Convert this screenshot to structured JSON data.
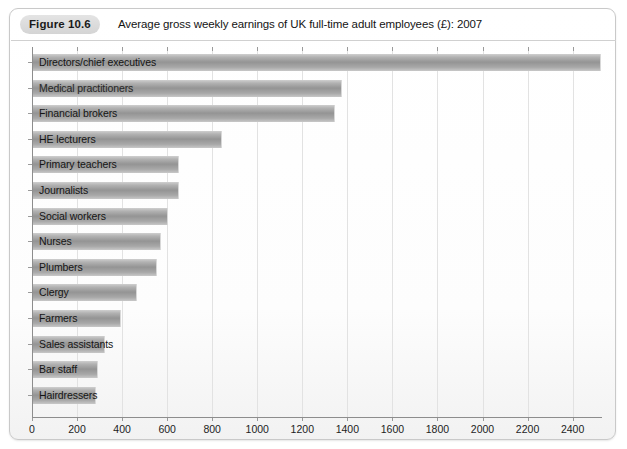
{
  "figure": {
    "badge": "Figure 10.6",
    "title": "Average gross weekly earnings of UK full-time adult employees (£): 2007"
  },
  "chart_data": {
    "type": "bar",
    "orientation": "horizontal",
    "title": "Average gross weekly earnings of UK full-time adult employees (£): 2007",
    "xlabel": "",
    "ylabel": "",
    "xlim": [
      0,
      2530
    ],
    "xticks": [
      0,
      200,
      400,
      600,
      800,
      1000,
      1200,
      1400,
      1600,
      1800,
      2000,
      2200,
      2400
    ],
    "grid": true,
    "legend": false,
    "bar_color": "#9a9a9a",
    "categories": [
      "Directors/chief executives",
      "Medical practitioners",
      "Financial brokers",
      "HE lecturers",
      "Primary teachers",
      "Journalists",
      "Social workers",
      "Nurses",
      "Plumbers",
      "Clergy",
      "Farmers",
      "Sales assistants",
      "Bar staff",
      "Hairdressers"
    ],
    "values": [
      2520,
      1370,
      1340,
      840,
      650,
      650,
      600,
      570,
      550,
      460,
      390,
      320,
      290,
      280
    ]
  },
  "axis": {
    "tick_labels": [
      "0",
      "200",
      "400",
      "600",
      "800",
      "1000",
      "1200",
      "1400",
      "1600",
      "1800",
      "2000",
      "2200",
      "2400"
    ]
  }
}
